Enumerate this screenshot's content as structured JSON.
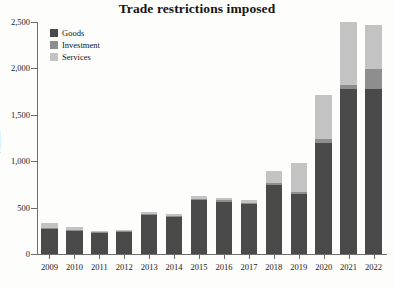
{
  "chart_data": {
    "type": "bar",
    "subtype": "stacked-vertical",
    "title": "Trade restrictions imposed",
    "xlabel": "",
    "ylabel": "Number",
    "ylim": [
      0,
      2500
    ],
    "yticks": [
      0,
      500,
      1000,
      1500,
      2000,
      2500
    ],
    "ytick_labels": [
      "0",
      "500",
      "1,000",
      "1,500",
      "2,000",
      "2,500"
    ],
    "grid": false,
    "legend_position": "top-left",
    "categories": [
      "2009",
      "2010",
      "2011",
      "2012",
      "2013",
      "2014",
      "2015",
      "2016",
      "2017",
      "2018",
      "2019",
      "2020",
      "2021",
      "2022"
    ],
    "series": [
      {
        "name": "Goods",
        "color": "#4a4a4a",
        "values": [
          270,
          245,
          230,
          235,
          420,
          395,
          585,
          565,
          540,
          745,
          645,
          1200,
          1780,
          1775
        ]
      },
      {
        "name": "Investment",
        "color": "#8e8e8e",
        "values": [
          15,
          10,
          8,
          8,
          12,
          10,
          12,
          12,
          12,
          25,
          25,
          40,
          45,
          215
        ]
      },
      {
        "name": "Services",
        "color": "#c3c3c3",
        "values": [
          45,
          35,
          12,
          12,
          25,
          25,
          25,
          25,
          30,
          120,
          315,
          470,
          670,
          480
        ]
      }
    ],
    "totals": [
      330,
      290,
      250,
      255,
      457,
      430,
      622,
      602,
      582,
      890,
      985,
      1710,
      2495,
      2470
    ]
  },
  "legend": {
    "items": [
      {
        "label": "Goods",
        "color": "#4a4a4a",
        "swatch_name": "goods-swatch"
      },
      {
        "label": "Investment",
        "color": "#8e8e8e",
        "swatch_name": "investment-swatch"
      },
      {
        "label": "Services",
        "color": "#c3c3c3",
        "swatch_name": "services-swatch"
      }
    ]
  },
  "colors": {
    "goods": "#4a4a4a",
    "investment": "#8e8e8e",
    "services": "#c3c3c3",
    "axis": "#6e6e6e",
    "text": "#1b1b1b",
    "background": "#fdfdfc"
  }
}
